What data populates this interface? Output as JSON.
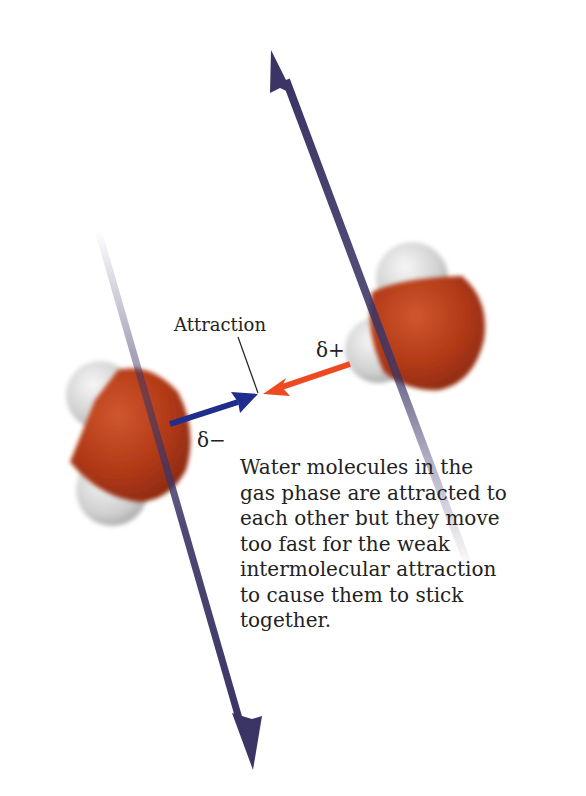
{
  "diagram": {
    "labels": {
      "attraction": "Attraction",
      "delta_plus": "δ+",
      "delta_minus": "δ−"
    },
    "caption": "Water molecules in the gas phase are attracted to each other but they move too fast for the weak intermolecular attraction to cause them to stick together.",
    "colors": {
      "oxygen": "#b8401c",
      "hydrogen": "#d9d9d9",
      "motion_arrow": "#3b3566",
      "negative_arrow": "#1f2e8c",
      "positive_arrow": "#ee4a22"
    }
  }
}
